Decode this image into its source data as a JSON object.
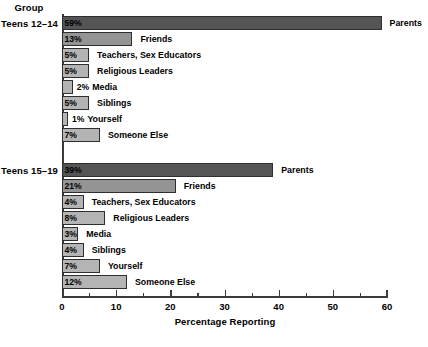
{
  "chart_data": {
    "type": "bar",
    "orientation": "horizontal",
    "title": "",
    "xlabel": "Percentage Reporting",
    "ylabel": "Group",
    "xlim": [
      0,
      60
    ],
    "xticks": [
      0,
      10,
      20,
      30,
      40,
      50,
      60
    ],
    "xtick_labels": [
      "0",
      "10",
      "20",
      "30",
      "40",
      "50",
      "60"
    ],
    "xminor_ticks": [
      5,
      15,
      25,
      35,
      45,
      55
    ],
    "grid": false,
    "legend": false,
    "categories": [
      "Parents",
      "Friends",
      "Teachers, Sex Educators",
      "Religious Leaders",
      "Media",
      "Siblings",
      "Yourself",
      "Someone Else"
    ],
    "series": [
      {
        "name": "Teens 12–14",
        "values": [
          59,
          13,
          5,
          5,
          2,
          5,
          1,
          7
        ],
        "value_labels": [
          "59%",
          "13%",
          "5%",
          "5%",
          "2%",
          "5%",
          "1%",
          "7%"
        ]
      },
      {
        "name": "Teens 15–19",
        "values": [
          39,
          21,
          4,
          8,
          3,
          4,
          7,
          12
        ],
        "value_labels": [
          "39%",
          "21%",
          "4%",
          "8%",
          "3%",
          "4%",
          "7%",
          "12%"
        ]
      }
    ]
  },
  "axis": {
    "group_header": "Group",
    "x_title": "Percentage Reporting",
    "tick_labels": [
      "0",
      "10",
      "20",
      "30",
      "40",
      "50",
      "60"
    ]
  },
  "groups": [
    {
      "label": "Teens 12–14",
      "bars": [
        {
          "value_label": "59%",
          "category": "Parents",
          "value": 59,
          "shade": "dark",
          "label_inside": true
        },
        {
          "value_label": "13%",
          "category": "Friends",
          "value": 13,
          "shade": "medium",
          "label_inside": true
        },
        {
          "value_label": "5%",
          "category": "Teachers, Sex Educators",
          "value": 5,
          "shade": "light",
          "label_inside": true
        },
        {
          "value_label": "5%",
          "category": "Religious Leaders",
          "value": 5,
          "shade": "light",
          "label_inside": true
        },
        {
          "value_label": "2%",
          "category": "Media",
          "value": 2,
          "shade": "light",
          "label_inside": false
        },
        {
          "value_label": "5%",
          "category": "Siblings",
          "value": 5,
          "shade": "light",
          "label_inside": true
        },
        {
          "value_label": "1%",
          "category": "Yourself",
          "value": 1,
          "shade": "light",
          "label_inside": false
        },
        {
          "value_label": "7%",
          "category": "Someone Else",
          "value": 7,
          "shade": "light",
          "label_inside": true
        }
      ]
    },
    {
      "label": "Teens 15–19",
      "bars": [
        {
          "value_label": "39%",
          "category": "Parents",
          "value": 39,
          "shade": "dark",
          "label_inside": true
        },
        {
          "value_label": "21%",
          "category": "Friends",
          "value": 21,
          "shade": "medium",
          "label_inside": true
        },
        {
          "value_label": "4%",
          "category": "Teachers, Sex Educators",
          "value": 4,
          "shade": "light",
          "label_inside": true
        },
        {
          "value_label": "8%",
          "category": "Religious Leaders",
          "value": 8,
          "shade": "light",
          "label_inside": true
        },
        {
          "value_label": "3%",
          "category": "Media",
          "value": 3,
          "shade": "light",
          "label_inside": true
        },
        {
          "value_label": "4%",
          "category": "Siblings",
          "value": 4,
          "shade": "light",
          "label_inside": true
        },
        {
          "value_label": "7%",
          "category": "Yourself",
          "value": 7,
          "shade": "light",
          "label_inside": true
        },
        {
          "value_label": "12%",
          "category": "Someone Else",
          "value": 12,
          "shade": "light",
          "label_inside": true
        }
      ]
    }
  ],
  "colors": {
    "bar_light": "#b4b4b4",
    "bar_medium": "#949494",
    "bar_dark": "#555555",
    "bar_border": "#2e2e2e",
    "axis": "#3b3b3b",
    "text": "#000000",
    "background": "#ffffff"
  }
}
